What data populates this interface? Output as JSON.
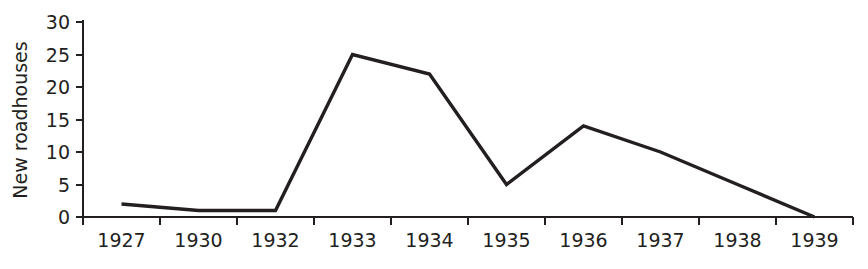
{
  "chart_data": {
    "type": "line",
    "title": "",
    "xlabel": "",
    "ylabel": "New roadhouses",
    "categories": [
      "1927",
      "1930",
      "1932",
      "1933",
      "1934",
      "1935",
      "1936",
      "1937",
      "1938",
      "1939"
    ],
    "values": [
      2,
      1,
      1,
      25,
      22,
      5,
      14,
      10,
      5,
      0
    ],
    "series": [
      {
        "name": "New roadhouses",
        "values": [
          2,
          1,
          1,
          25,
          22,
          5,
          14,
          10,
          5,
          0
        ]
      }
    ],
    "ylim": [
      0,
      30
    ],
    "yticks": [
      0,
      5,
      10,
      15,
      20,
      25,
      30
    ],
    "ytick_labels": [
      "0",
      "5",
      "10",
      "15",
      "20",
      "25",
      "30"
    ],
    "grid": false,
    "legend": false,
    "legend_position": "none",
    "line_color": "#231f20",
    "axis_color": "#231f20",
    "background_color": "#ffffff"
  }
}
